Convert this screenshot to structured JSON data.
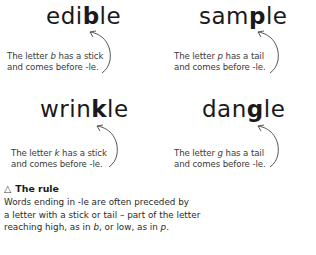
{
  "examples": [
    {
      "word_pre": "edi",
      "word_key": "b",
      "word_post": "le",
      "caption_line1_pre": "The letter ",
      "caption_letter": "b",
      "caption_line1_post": " has a stick",
      "caption_line2": "and comes before  -le."
    },
    {
      "word_pre": "sam",
      "word_key": "p",
      "word_post": "le",
      "caption_line1_pre": "The letter ",
      "caption_letter": "p",
      "caption_line1_post": " has a tail",
      "caption_line2": "and comes before -le."
    },
    {
      "word_pre": "wrin",
      "word_key": "k",
      "word_post": "le",
      "caption_line1_pre": "The letter ",
      "caption_letter": "k",
      "caption_line1_post": " has a stick",
      "caption_line2": "and comes before -le."
    },
    {
      "word_pre": "dan",
      "word_key": "g",
      "word_post": "le",
      "caption_line1_pre": "The letter ",
      "caption_letter": "g",
      "caption_line1_post": " has a tail",
      "caption_line2": "and comes before -le."
    }
  ],
  "rule": {
    "icon": "warning-triangle-icon",
    "icon_glyph": "△",
    "title": "The rule",
    "line1": "Words ending in -le are often preceded by",
    "line2": "a letter with a stick or tail – part of the letter",
    "line3_a": "reaching high, as in ",
    "line3_b": "b",
    "line3_c": ", or low, as in ",
    "line3_d": "p",
    "line3_e": "."
  }
}
